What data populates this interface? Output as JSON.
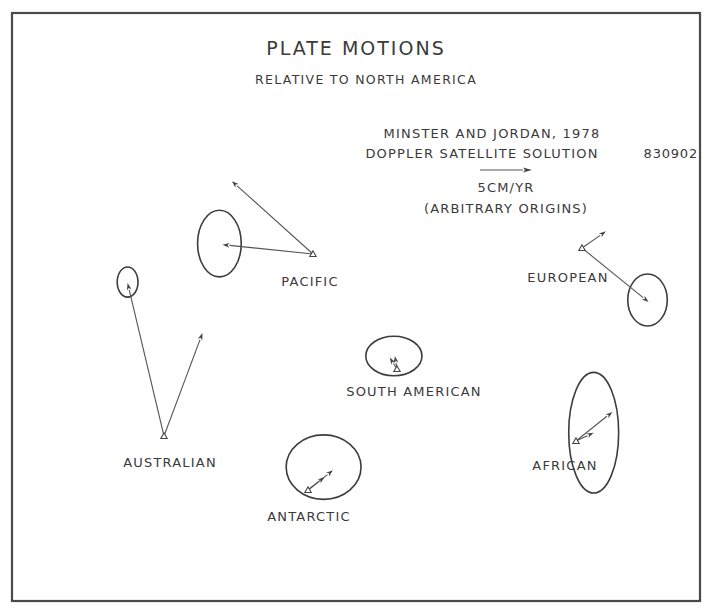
{
  "diagram": {
    "title": "PLATE MOTIONS",
    "subtitle": "RELATIVE TO NORTH AMERICA",
    "legend": {
      "source": "MINSTER AND JORDAN, 1978",
      "solution": "DOPPLER SATELLITE SOLUTION",
      "id_code": "830902",
      "scale_value_cm_per_yr": 5,
      "scale_label": "5CM/YR",
      "note": "(ARBITRARY ORIGINS)"
    },
    "colors": {
      "ink": "#3a3a3a",
      "paper": "#ffffff"
    }
  },
  "chart_data": {
    "type": "vector-field",
    "title": "PLATE MOTIONS",
    "subtitle": "RELATIVE TO NORTH AMERICA",
    "units": "cm/yr",
    "scale_reference_cm_per_yr": 5,
    "note": "Arbitrary origins; vector components as drawn (east, north), ellipses are error ellipses in cm/yr (semi-axes east, north)",
    "plates": [
      {
        "name": "PACIFIC",
        "vectors": [
          {
            "de": -8.7,
            "dn": 0.9
          },
          {
            "de": -7.8,
            "dn": 7.0
          }
        ],
        "ellipse": {
          "de": -9.0,
          "dn": 1.0,
          "ae": 2.1,
          "an": 3.2
        }
      },
      {
        "name": "AUSTRALIAN",
        "vectors": [
          {
            "de": -3.5,
            "dn": 14.7
          },
          {
            "de": 3.7,
            "dn": 9.9
          }
        ],
        "ellipse": {
          "de": -3.5,
          "dn": 14.8,
          "ae": 1.0,
          "an": 1.45
        }
      },
      {
        "name": "SOUTH AMERICAN",
        "vectors": [
          {
            "de": -0.7,
            "dn": 1.1
          },
          {
            "de": -0.2,
            "dn": 1.25
          }
        ],
        "ellipse": {
          "de": -0.3,
          "dn": 1.25,
          "ae": 2.7,
          "an": 1.9
        }
      },
      {
        "name": "EUROPEAN",
        "vectors": [
          {
            "de": 2.3,
            "dn": 1.6
          },
          {
            "de": 6.4,
            "dn": -5.2
          }
        ],
        "ellipse": {
          "de": 6.3,
          "dn": -5.0,
          "ae": 1.9,
          "an": 2.5
        }
      },
      {
        "name": "AFRICAN",
        "vectors": [
          {
            "de": 3.5,
            "dn": 2.8
          },
          {
            "de": 1.7,
            "dn": 0.8
          }
        ],
        "ellipse": {
          "de": 1.7,
          "dn": 0.8,
          "ae": 2.4,
          "an": 5.8
        }
      },
      {
        "name": "ANTARCTIC",
        "vectors": [
          {
            "de": 2.4,
            "dn": 1.9
          },
          {
            "de": 1.6,
            "dn": 1.25
          }
        ],
        "ellipse": {
          "de": 1.5,
          "dn": 2.2,
          "ae": 3.6,
          "an": 3.1
        }
      }
    ]
  }
}
